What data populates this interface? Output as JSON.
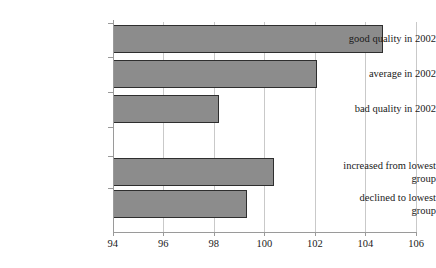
{
  "chart_data": {
    "type": "bar",
    "orientation": "horizontal",
    "title": "",
    "xlabel": "",
    "ylabel": "",
    "xlim": [
      94,
      106
    ],
    "ylim": [],
    "grid": true,
    "legend": false,
    "xticks": [
      94,
      96,
      98,
      100,
      102,
      104,
      106
    ],
    "xtick_labels": [
      "94",
      "96",
      "98",
      "100",
      "102",
      "104",
      "106"
    ],
    "categories": [
      "good quality in 2002",
      "average in 2002",
      "bad quality in 2002",
      "",
      "increased from lowest group",
      "declined to lowest group"
    ],
    "values": [
      104.7,
      102.1,
      98.2,
      null,
      100.4,
      99.3
    ],
    "bar_color": "#8c8c8c",
    "bar_edge_color": "#2e2e2e",
    "grid_color": "#c9c9c9",
    "axis_color": "#9a9a9a",
    "bars": [
      {
        "label": "good quality in 2002",
        "label_line1": "good quality in 2002",
        "label_line2": "",
        "value": 104.7
      },
      {
        "label": "average in 2002",
        "label_line1": "average in 2002",
        "label_line2": "",
        "value": 102.1
      },
      {
        "label": "bad quality in 2002",
        "label_line1": "bad quality in 2002",
        "label_line2": "",
        "value": 98.2
      },
      {
        "label": "increased from lowest group",
        "label_line1": "increased from lowest",
        "label_line2": "group",
        "value": 100.4
      },
      {
        "label": "declined to lowest group",
        "label_line1": "declined to lowest",
        "label_line2": "group",
        "value": 99.3
      }
    ]
  }
}
